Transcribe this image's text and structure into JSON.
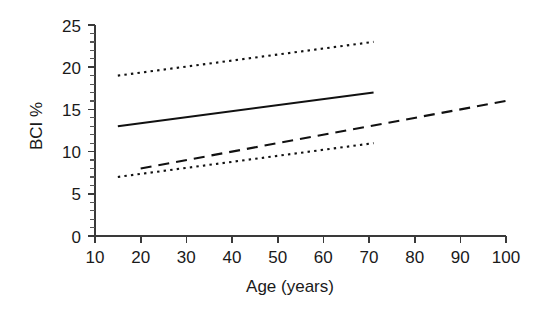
{
  "chart_data": {
    "type": "line",
    "title": "",
    "xlabel": "Age (years)",
    "ylabel": "BCI %",
    "xlim": [
      10,
      100
    ],
    "ylim": [
      0,
      25
    ],
    "grid": false,
    "legend": null,
    "x_ticks": [
      10,
      20,
      30,
      40,
      50,
      60,
      70,
      80,
      90,
      100
    ],
    "x_tick_labels": [
      "10",
      "20",
      "30",
      "40",
      "50",
      "60",
      "70",
      "80",
      "90",
      "100"
    ],
    "y_ticks": [
      0,
      5,
      10,
      15,
      20,
      25
    ],
    "y_tick_labels": [
      "0",
      "5",
      "10",
      "15",
      "20",
      "25"
    ],
    "y_minor_tick_step": 1,
    "series": [
      {
        "name": "upper-confidence-limit",
        "style": "dotted",
        "color": "#111111",
        "x": [
          15,
          71
        ],
        "values": [
          19,
          23
        ]
      },
      {
        "name": "regression-line",
        "style": "solid",
        "color": "#111111",
        "x": [
          15,
          71
        ],
        "values": [
          13,
          17
        ]
      },
      {
        "name": "second-group-line",
        "style": "dashed",
        "color": "#111111",
        "x": [
          20,
          100
        ],
        "values": [
          8,
          16
        ]
      },
      {
        "name": "lower-confidence-limit",
        "style": "dotted",
        "color": "#111111",
        "x": [
          15,
          71
        ],
        "values": [
          7,
          11
        ]
      }
    ]
  },
  "labels": {
    "x_axis_title": "Age (years)",
    "y_axis_title": "BCI %",
    "x_tick_10": "10",
    "x_tick_20": "20",
    "x_tick_30": "30",
    "x_tick_40": "40",
    "x_tick_50": "50",
    "x_tick_60": "60",
    "x_tick_70": "70",
    "x_tick_80": "80",
    "x_tick_90": "90",
    "x_tick_100": "100",
    "y_tick_0": "0",
    "y_tick_5": "5",
    "y_tick_10": "10",
    "y_tick_15": "15",
    "y_tick_20": "20",
    "y_tick_25": "25"
  },
  "colors": {
    "background": "#ffffff",
    "axis": "#3a3a3a",
    "ink": "#111111",
    "text": "#1a1a1a"
  }
}
